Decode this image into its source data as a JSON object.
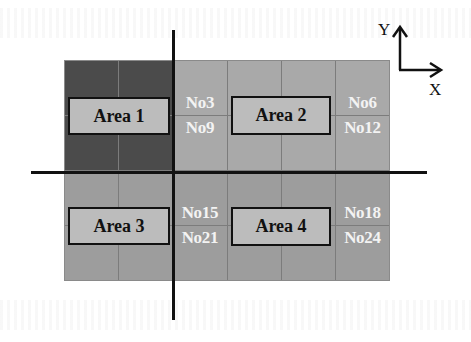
{
  "diagram": {
    "colors": {
      "highlight_cells": "#4b4b4b",
      "upper_cells": "#a9a9a9",
      "lower_cells": "#9d9d9d",
      "area_box": "#bcbcbc",
      "cell_text": "#f3f3f3",
      "line": "#111111"
    },
    "cells": [
      {
        "id": "No1",
        "highlighted": true
      },
      {
        "id": "No2",
        "highlighted": true
      },
      {
        "id": "No3",
        "highlighted": false
      },
      {
        "id": "No4",
        "highlighted": false
      },
      {
        "id": "No5",
        "highlighted": false
      },
      {
        "id": "No6",
        "highlighted": false
      },
      {
        "id": "No7",
        "highlighted": true
      },
      {
        "id": "No8",
        "highlighted": true
      },
      {
        "id": "No9",
        "highlighted": false
      },
      {
        "id": "No10",
        "highlighted": false
      },
      {
        "id": "No11",
        "highlighted": false
      },
      {
        "id": "No12",
        "highlighted": false
      },
      {
        "id": "No13",
        "highlighted": false
      },
      {
        "id": "No14",
        "highlighted": false
      },
      {
        "id": "No15",
        "highlighted": false
      },
      {
        "id": "No16",
        "highlighted": false
      },
      {
        "id": "No17",
        "highlighted": false
      },
      {
        "id": "No18",
        "highlighted": false
      },
      {
        "id": "No19",
        "highlighted": false
      },
      {
        "id": "No20",
        "highlighted": false
      },
      {
        "id": "No21",
        "highlighted": false
      },
      {
        "id": "No22",
        "highlighted": false
      },
      {
        "id": "No23",
        "highlighted": false
      },
      {
        "id": "No24",
        "highlighted": false
      }
    ],
    "areas": [
      {
        "label": "Area 1"
      },
      {
        "label": "Area 2"
      },
      {
        "label": "Area 3"
      },
      {
        "label": "Area 4"
      }
    ],
    "axes": {
      "x_label": "X",
      "y_label": "Y"
    }
  }
}
